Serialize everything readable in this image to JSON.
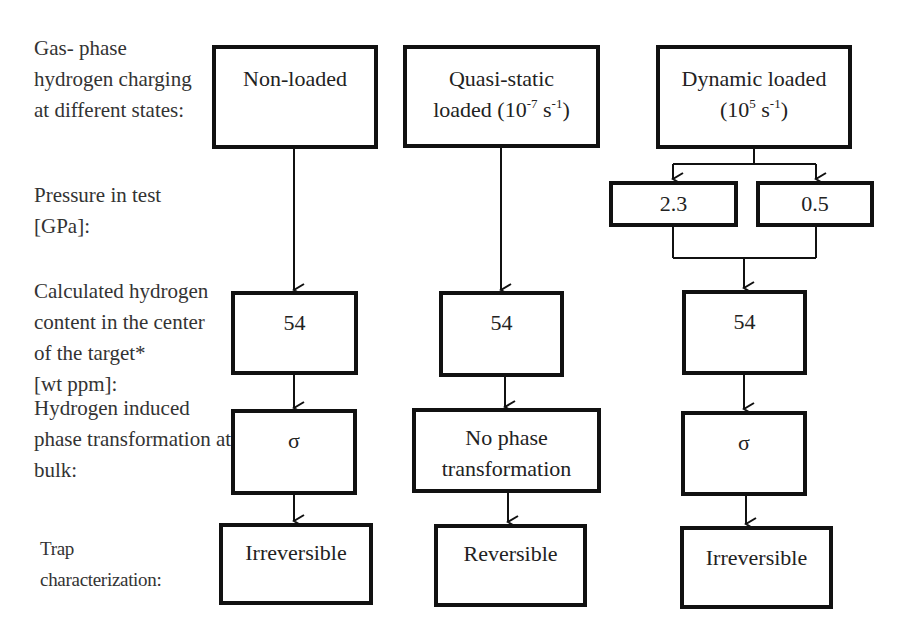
{
  "row_labels": {
    "charging": [
      "Gas- phase",
      "hydrogen charging",
      "at different states:"
    ],
    "pressure": [
      "Pressure in test",
      "[GPa]:"
    ],
    "content": [
      "Calculated hydrogen",
      "content in the center",
      "of the target*",
      "[wt  ppm]:"
    ],
    "phase": [
      "Hydrogen induced",
      "phase transformation at",
      "bulk:"
    ],
    "trap": [
      "Trap",
      "characterization:"
    ]
  },
  "columns": [
    {
      "state": {
        "line1": "Non-loaded"
      },
      "content": "54",
      "phase": [
        "σ"
      ],
      "trap": "Irreversible"
    },
    {
      "state": {
        "line1": "Quasi-static",
        "line2_pre": "loaded (10",
        "rate_exp": "-7",
        "line2_mid": " s",
        "unit_exp": "-1",
        "line2_post": ")"
      },
      "content": "54",
      "phase": [
        "No phase",
        "transformation"
      ],
      "trap": "Reversible"
    },
    {
      "state": {
        "line1": "Dynamic loaded",
        "line2_pre": "(10",
        "rate_exp": "5",
        "line2_mid": " s",
        "unit_exp": "-1",
        "line2_post": ")"
      },
      "pressures": [
        "2.3",
        "0.5"
      ],
      "content": "54",
      "phase": [
        "σ"
      ],
      "trap": "Irreversible"
    }
  ],
  "colors": {
    "line": "#111111",
    "text": "#222222",
    "background": "#ffffff"
  }
}
